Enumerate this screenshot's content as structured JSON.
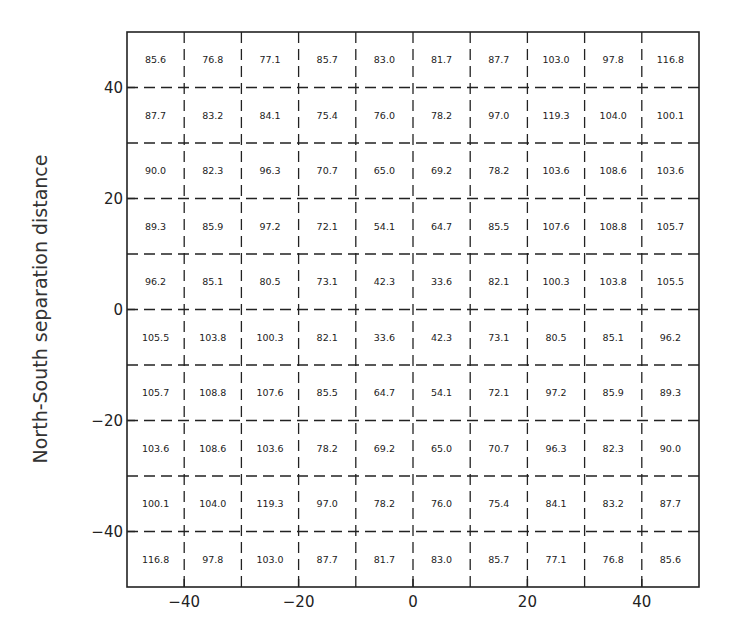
{
  "chart_data": {
    "type": "table",
    "title": "",
    "xlabel": "",
    "ylabel": "North-South separation distance",
    "xlim": [
      -50,
      50
    ],
    "ylim": [
      -50,
      50
    ],
    "x_ticks": [
      -40,
      -20,
      0,
      20,
      40
    ],
    "y_ticks": [
      -40,
      -20,
      0,
      20,
      40
    ],
    "x_tick_labels": [
      "−40",
      "−20",
      "0",
      "20",
      "40"
    ],
    "y_tick_labels": [
      "−40",
      "−20",
      "0",
      "20",
      "40"
    ],
    "grid": "dashed, 10 units",
    "cell_size": 10,
    "x_centers": [
      -45,
      -35,
      -25,
      -15,
      -5,
      5,
      15,
      25,
      35,
      45
    ],
    "y_centers_top_to_bottom": [
      45,
      35,
      25,
      15,
      5,
      -5,
      -15,
      -25,
      -35,
      -45
    ],
    "rows_top_to_bottom": [
      [
        "85.6",
        "76.8",
        "77.1",
        "85.7",
        "83.0",
        "81.7",
        "87.7",
        "103.0",
        "97.8",
        "116.8"
      ],
      [
        "87.7",
        "83.2",
        "84.1",
        "75.4",
        "76.0",
        "78.2",
        "97.0",
        "119.3",
        "104.0",
        "100.1"
      ],
      [
        "90.0",
        "82.3",
        "96.3",
        "70.7",
        "65.0",
        "69.2",
        "78.2",
        "103.6",
        "108.6",
        "103.6"
      ],
      [
        "89.3",
        "85.9",
        "97.2",
        "72.1",
        "54.1",
        "64.7",
        "85.5",
        "107.6",
        "108.8",
        "105.7"
      ],
      [
        "96.2",
        "85.1",
        "80.5",
        "73.1",
        "42.3",
        "33.6",
        "82.1",
        "100.3",
        "103.8",
        "105.5"
      ],
      [
        "105.5",
        "103.8",
        "100.3",
        "82.1",
        "33.6",
        "42.3",
        "73.1",
        "80.5",
        "85.1",
        "96.2"
      ],
      [
        "105.7",
        "108.8",
        "107.6",
        "85.5",
        "64.7",
        "54.1",
        "72.1",
        "97.2",
        "85.9",
        "89.3"
      ],
      [
        "103.6",
        "108.6",
        "103.6",
        "78.2",
        "69.2",
        "65.0",
        "70.7",
        "96.3",
        "82.3",
        "90.0"
      ],
      [
        "100.1",
        "104.0",
        "119.3",
        "97.0",
        "78.2",
        "76.0",
        "75.4",
        "84.1",
        "83.2",
        "87.7"
      ],
      [
        "116.8",
        "97.8",
        "103.0",
        "87.7",
        "81.7",
        "83.0",
        "85.7",
        "77.1",
        "76.8",
        "85.6"
      ]
    ]
  },
  "colors": {
    "frame": "#222222",
    "grid": "#222222",
    "text": "#222222",
    "background": "#ffffff"
  }
}
